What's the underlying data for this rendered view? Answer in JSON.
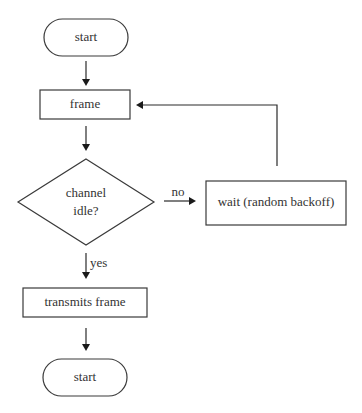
{
  "diagram": {
    "type": "flowchart",
    "nodes": [
      {
        "id": "start1",
        "shape": "terminator",
        "label": "start"
      },
      {
        "id": "frame",
        "shape": "process",
        "label": "frame"
      },
      {
        "id": "decision",
        "shape": "decision",
        "label_line1": "channel",
        "label_line2": "idle?"
      },
      {
        "id": "wait",
        "shape": "process",
        "label": "wait (random backoff)"
      },
      {
        "id": "transmit",
        "shape": "process",
        "label": "transmits frame"
      },
      {
        "id": "start2",
        "shape": "terminator",
        "label": "start"
      }
    ],
    "edges": [
      {
        "from": "start1",
        "to": "frame",
        "label": ""
      },
      {
        "from": "frame",
        "to": "decision",
        "label": ""
      },
      {
        "from": "decision",
        "to": "wait",
        "label": "no"
      },
      {
        "from": "wait",
        "to": "frame",
        "label": ""
      },
      {
        "from": "decision",
        "to": "transmit",
        "label": "yes"
      },
      {
        "from": "transmit",
        "to": "start2",
        "label": ""
      }
    ],
    "labels": {
      "start1": "start",
      "frame": "frame",
      "decision_line1": "channel",
      "decision_line2": "idle?",
      "wait": "wait (random backoff)",
      "transmit": "transmits frame",
      "start2": "start",
      "edge_no": "no",
      "edge_yes": "yes"
    }
  }
}
